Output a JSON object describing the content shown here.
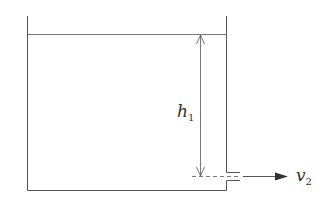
{
  "diagram": {
    "type": "tank-outflow",
    "labels": {
      "height": "h",
      "height_sub": "1",
      "velocity": "v",
      "velocity_sub": "2"
    },
    "colors": {
      "stroke": "#555555",
      "background": "#ffffff"
    }
  }
}
